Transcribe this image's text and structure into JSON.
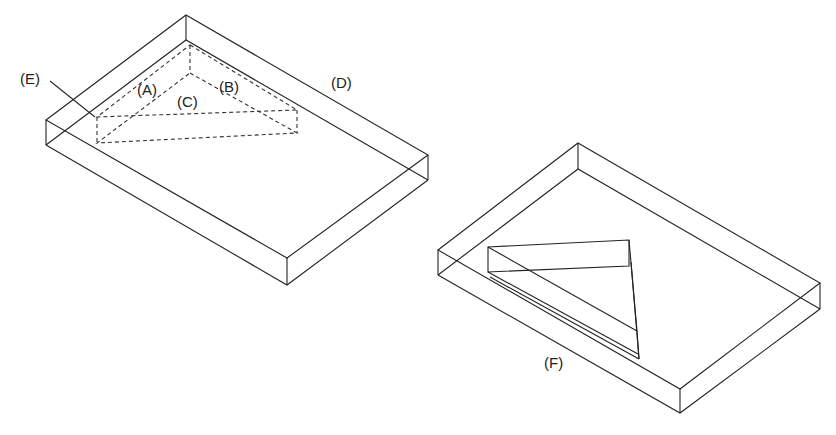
{
  "figure": {
    "type": "technical-isometric-diagram",
    "line_color": "#222222",
    "background": "#ffffff"
  },
  "left_panel": {
    "description": "Rectangular slab with a hidden (dashed) triangular prism near the back corner",
    "labels": {
      "A": "(A)",
      "B": "(B)",
      "C": "(C)",
      "D": "(D)",
      "E": "(E)"
    }
  },
  "right_panel": {
    "description": "Rectangular slab with a visible triangular prism cut-out/insert",
    "labels": {
      "F": "(F)"
    }
  }
}
